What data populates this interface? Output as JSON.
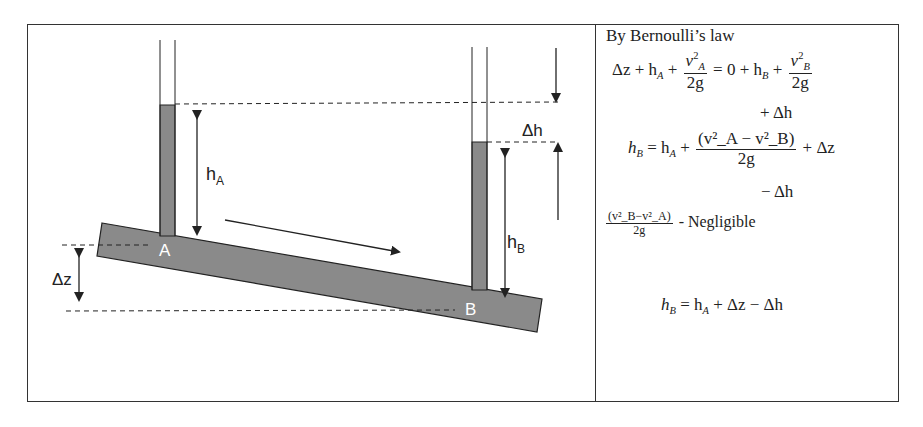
{
  "diagram": {
    "labels": {
      "h_a": "h",
      "h_a_sub": "A",
      "h_b": "h",
      "h_b_sub": "B",
      "delta_h": "Δh",
      "delta_z": "Δz",
      "point_a": "A",
      "point_b": "B"
    },
    "colors": {
      "pipe_fill": "#8a8a8a",
      "stroke": "#222222",
      "point_label": "#ffffff"
    }
  },
  "derivation": {
    "heading": "By Bernoulli’s law",
    "eq1_lhs": "Δz + h",
    "eq1_lhs_sub": "A",
    "eq1_plus": " + ",
    "eq1_num": "v",
    "eq1_num_sup": "2",
    "eq1_num_sub": "A",
    "eq1_den": "2g",
    "eq1_mid": " = 0 + h",
    "eq1_mid_sub": "B",
    "eq1_plus2": " + ",
    "eq1_num2": "v",
    "eq1_num2_sup": "2",
    "eq1_num2_sub": "B",
    "eq1_den2": "2g",
    "eq1_cont": "+ Δh",
    "eq2_lhs": "h",
    "eq2_lhs_sub": "B",
    "eq2_mid": " = h",
    "eq2_mid_sub": "A",
    "eq2_plus": " + ",
    "eq2_num": "(v²_A − v²_B)",
    "eq2_den": "2g",
    "eq2_tail": " + Δz",
    "eq2_cont": "− Δh",
    "neg_num": "(v²_B−v²_A)",
    "neg_den": "2g",
    "neg_text": " -  Negligible",
    "eq3": "h_B = h_A + Δz − Δh",
    "eq3_h1": "h",
    "eq3_s1": "B",
    "eq3_mid": " = h",
    "eq3_s2": "A",
    "eq3_tail": " + Δz − Δh"
  }
}
